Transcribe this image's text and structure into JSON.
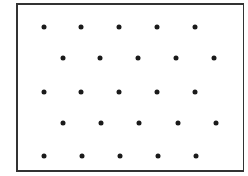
{
  "diagram": {
    "type": "dot-lattice",
    "dot_color": "#1a1a1a",
    "frame_color": "#333333",
    "rows": [
      {
        "y": 27,
        "x": [
          44,
          81,
          119,
          157,
          195
        ]
      },
      {
        "y": 58,
        "x": [
          63,
          100,
          138,
          176,
          214
        ]
      },
      {
        "y": 92,
        "x": [
          44,
          81,
          119,
          157,
          195
        ]
      },
      {
        "y": 123,
        "x": [
          63,
          101,
          139,
          178,
          216
        ]
      },
      {
        "y": 156,
        "x": [
          44,
          82,
          120,
          158,
          196
        ]
      }
    ]
  }
}
